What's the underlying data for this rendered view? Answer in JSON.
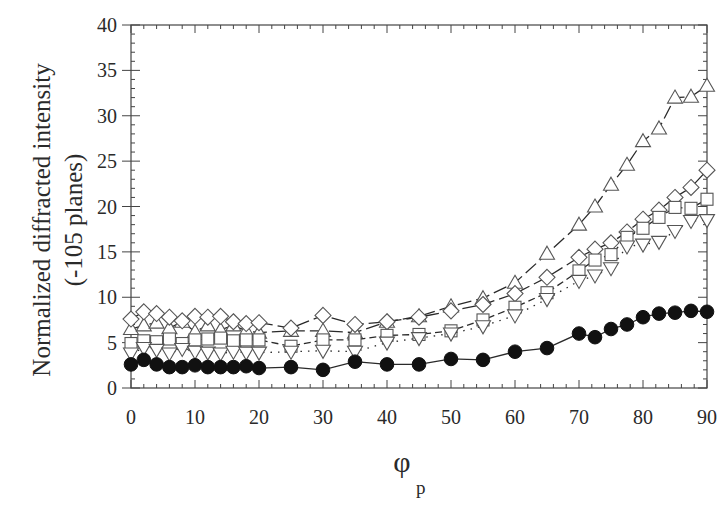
{
  "chart_data": {
    "type": "line",
    "title": "",
    "xlabel": "φ",
    "xlabel_subscript": "p",
    "ylabel": "Normalized diffracted intensity",
    "ylabel_line2": "(-105 planes)",
    "xlim": [
      0,
      90
    ],
    "ylim": [
      0,
      40
    ],
    "xticks": [
      0,
      10,
      20,
      30,
      40,
      50,
      60,
      70,
      80,
      90
    ],
    "yticks": [
      0,
      5,
      10,
      15,
      20,
      25,
      30,
      35,
      40
    ],
    "x_minor_step": 2,
    "y_minor_step": 1,
    "grid": false,
    "legend": null,
    "series": [
      {
        "name": "up-triangle",
        "marker": "triangle-up",
        "filled": false,
        "line": "long-dash",
        "x": [
          0,
          2,
          4,
          6,
          8,
          10,
          12,
          14,
          16,
          18,
          20,
          25,
          30,
          35,
          40,
          45,
          50,
          55,
          60,
          65,
          70,
          72.5,
          75,
          77.5,
          80,
          82.5,
          85,
          87.5,
          90
        ],
        "values": [
          6.5,
          6.9,
          7.2,
          6.6,
          7.3,
          6.2,
          6.9,
          6.4,
          6.9,
          6.3,
          6.1,
          6.3,
          6.3,
          6.1,
          7.3,
          7.9,
          9.0,
          9.9,
          11.6,
          14.8,
          18.0,
          20.0,
          22.4,
          24.6,
          27.2,
          28.6,
          32.0,
          32.1,
          33.3
        ]
      },
      {
        "name": "diamond",
        "marker": "diamond",
        "filled": false,
        "line": "long-dash",
        "x": [
          0,
          2,
          4,
          6,
          8,
          10,
          12,
          14,
          16,
          18,
          20,
          25,
          30,
          35,
          40,
          45,
          50,
          55,
          60,
          65,
          70,
          72.5,
          75,
          77.5,
          80,
          82.5,
          85,
          87.5,
          90
        ],
        "values": [
          7.6,
          8.4,
          8.2,
          7.8,
          7.4,
          7.9,
          7.8,
          7.9,
          7.3,
          7.1,
          7.2,
          6.6,
          8.0,
          7.0,
          7.3,
          7.8,
          8.5,
          9.2,
          10.4,
          12.2,
          14.4,
          15.3,
          16.0,
          17.2,
          18.6,
          19.6,
          21.0,
          22.1,
          24.0
        ]
      },
      {
        "name": "square",
        "marker": "square",
        "filled": false,
        "line": "dash",
        "x": [
          0,
          2,
          4,
          6,
          8,
          10,
          12,
          14,
          16,
          18,
          20,
          25,
          30,
          35,
          40,
          45,
          50,
          55,
          60,
          65,
          70,
          72.5,
          75,
          77.5,
          80,
          82.5,
          85,
          87.5,
          90
        ],
        "values": [
          4.9,
          5.2,
          5.1,
          5.4,
          4.9,
          5.3,
          5.4,
          5.5,
          5.2,
          5.3,
          5.3,
          4.6,
          5.3,
          5.3,
          5.8,
          5.9,
          6.3,
          7.5,
          8.9,
          10.5,
          12.9,
          14.1,
          14.7,
          16.6,
          17.6,
          18.8,
          19.9,
          19.8,
          20.8
        ]
      },
      {
        "name": "down-triangle",
        "marker": "triangle-down",
        "filled": false,
        "line": "dotted",
        "x": [
          0,
          2,
          4,
          6,
          8,
          10,
          12,
          14,
          16,
          18,
          20,
          25,
          30,
          35,
          40,
          45,
          50,
          55,
          60,
          65,
          70,
          72.5,
          75,
          77.5,
          80,
          82.5,
          85,
          87.5,
          90
        ],
        "values": [
          3.8,
          4.4,
          4.2,
          3.8,
          4.3,
          4.0,
          3.9,
          3.8,
          4.0,
          3.9,
          3.9,
          4.0,
          4.1,
          4.0,
          5.0,
          5.5,
          6.0,
          6.8,
          8.0,
          9.8,
          11.8,
          12.4,
          13.2,
          15.6,
          15.8,
          16.1,
          17.3,
          18.4,
          18.5
        ]
      },
      {
        "name": "filled-circle",
        "marker": "circle",
        "filled": true,
        "line": "solid",
        "x": [
          0,
          2,
          4,
          6,
          8,
          10,
          12,
          14,
          16,
          18,
          20,
          25,
          30,
          35,
          40,
          45,
          50,
          55,
          60,
          65,
          70,
          72.5,
          75,
          77.5,
          80,
          82.5,
          85,
          87.5,
          90
        ],
        "values": [
          2.6,
          3.1,
          2.6,
          2.3,
          2.3,
          2.5,
          2.3,
          2.3,
          2.3,
          2.4,
          2.2,
          2.3,
          2.0,
          2.9,
          2.6,
          2.6,
          3.2,
          3.1,
          4.0,
          4.4,
          6.0,
          5.6,
          6.5,
          7.0,
          7.8,
          8.2,
          8.3,
          8.5,
          8.4
        ]
      }
    ]
  }
}
